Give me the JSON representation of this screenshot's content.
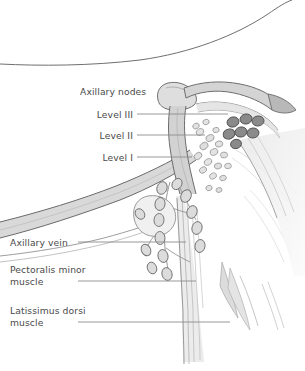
{
  "figure": {
    "background_color": "#ffffff",
    "label_color": "#4a4a4a",
    "leader_line_color": "#8c8c8c",
    "node_dark_color": "#8a8a8a",
    "node_light_color": "#d8d8d8",
    "muscle_fill_color": "#e2e2e2",
    "outline_color": "#5a5a5a"
  },
  "labels": {
    "axillary_nodes": "Axillary nodes",
    "level_3": "Level III",
    "level_2": "Level II",
    "level_1": "Level I",
    "axillary_vein": "Axillary vein",
    "pectoralis_minor_line1": "Pectoralis minor",
    "pectoralis_minor_line2": "muscle",
    "latissimus_dorsi_line1": "Latissimus dorsi",
    "latissimus_dorsi_line2": "muscle"
  },
  "anatomy": {
    "structures": [
      "shoulder-contour",
      "clavicle",
      "subclavian-vessels",
      "axillary-vein",
      "pectoralis-minor-muscle",
      "latissimus-dorsi-muscle",
      "apical-node-cluster",
      "central-node-cluster",
      "lateral-node-chain",
      "lymphatic-vessels"
    ],
    "node_counts": {
      "level_3_apical": 7,
      "level_2_central": 18,
      "level_1_lateral": 14
    }
  }
}
